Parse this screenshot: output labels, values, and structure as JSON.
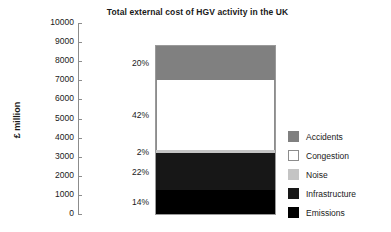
{
  "chart_data": {
    "type": "bar",
    "title": "Total external cost of HGV activity in the UK",
    "xlabel": "",
    "ylabel": "£ million",
    "ylim": [
      0,
      10000
    ],
    "grid": false,
    "legend_position": "right",
    "stacked": true,
    "categories": [
      "HGV"
    ],
    "total": 8800,
    "ytick_labels": [
      "10000",
      "9000",
      "8000",
      "7000",
      "6000",
      "5000",
      "4000",
      "3000",
      "2000",
      "1000",
      "0"
    ],
    "ytick_values": [
      10000,
      9000,
      8000,
      7000,
      6000,
      5000,
      4000,
      3000,
      2000,
      1000,
      0
    ],
    "series": [
      {
        "name": "Accidents",
        "percent": 20,
        "label": "20%",
        "value": 1760,
        "color": "#808080",
        "border": "#808080"
      },
      {
        "name": "Congestion",
        "percent": 42,
        "label": "42%",
        "value": 3696,
        "color": "#ffffff",
        "border": "#8c8c8c"
      },
      {
        "name": "Noise",
        "percent": 2,
        "label": "2%",
        "value": 176,
        "color": "#c4c4c4",
        "border": "#c4c4c4"
      },
      {
        "name": "Infrastructure",
        "percent": 22,
        "label": "22%",
        "value": 1936,
        "color": "#171717",
        "border": "#171717"
      },
      {
        "name": "Emissions",
        "percent": 14,
        "label": "14%",
        "value": 1232,
        "color": "#000000",
        "border": "#000000"
      }
    ],
    "legend": [
      {
        "label": "Accidents",
        "color": "#808080",
        "border": "#808080"
      },
      {
        "label": "Congestion",
        "color": "#ffffff",
        "border": "#8c8c8c"
      },
      {
        "label": "Noise",
        "color": "#c4c4c4",
        "border": "#c4c4c4"
      },
      {
        "label": "Infrastructure",
        "color": "#171717",
        "border": "#171717"
      },
      {
        "label": "Emissions",
        "color": "#000000",
        "border": "#000000"
      }
    ]
  }
}
